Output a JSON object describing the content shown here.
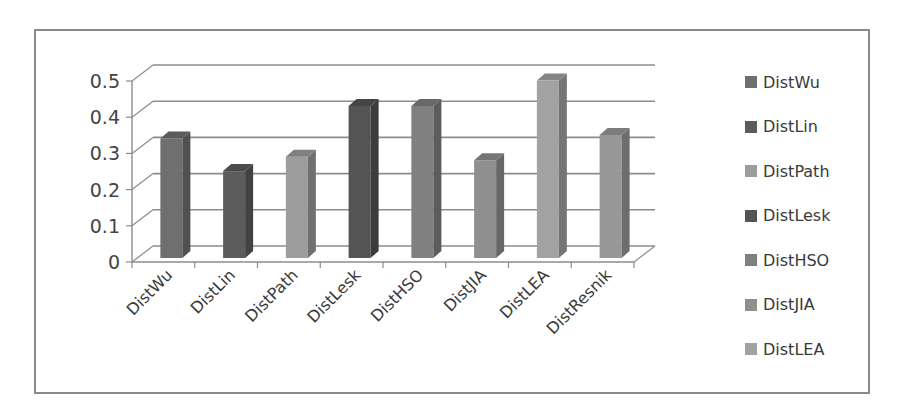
{
  "chart_data": {
    "type": "bar",
    "variant": "3d-column",
    "title": "",
    "xlabel": "",
    "ylabel": "",
    "categories": [
      "DistWu",
      "DistLin",
      "DistPath",
      "DistLesk",
      "DistHSO",
      "DistJIA",
      "DistLEA",
      "DistResnik"
    ],
    "values": [
      0.33,
      0.24,
      0.28,
      0.42,
      0.42,
      0.27,
      0.49,
      0.34
    ],
    "colors": [
      "#6f6f6f",
      "#5c5c5c",
      "#9c9c9c",
      "#545454",
      "#808080",
      "#8f8f8f",
      "#a2a2a2",
      "#979797"
    ],
    "ylim": [
      0,
      0.5
    ],
    "yticks": [
      0,
      0.1,
      0.2,
      0.3,
      0.4,
      0.5
    ],
    "ytick_labels": [
      "0",
      "0.1",
      "0.2",
      "0.3",
      "0.4",
      "0.5"
    ],
    "grid": true,
    "legend": {
      "position": "right",
      "entries": [
        "DistWu",
        "DistLin",
        "DistPath",
        "DistLesk",
        "DistHSO",
        "DistJIA",
        "DistLEA"
      ]
    }
  }
}
